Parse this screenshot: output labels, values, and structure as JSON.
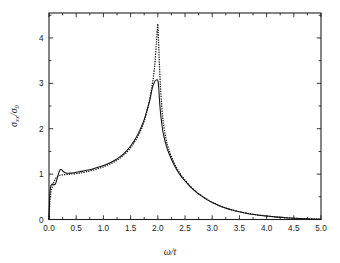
{
  "figure": {
    "background": "#ffffff",
    "foreground": "#1f1f1f"
  },
  "axis": {
    "x_title_main": "ω",
    "x_title_div": "/",
    "x_title_var": "t",
    "y_title_sigma": "σ",
    "y_title_sigma_sub": "xx",
    "y_title_div": "/",
    "y_title_sigma0": "σ",
    "y_title_sigma0_sub": "0",
    "x_ticks": [
      "0.0",
      "0.5",
      "1.0",
      "1.5",
      "2.0",
      "2.5",
      "3.0",
      "3.5",
      "4.0",
      "4.5",
      "5.0"
    ],
    "y_ticks": [
      "0",
      "1",
      "2",
      "3",
      "4"
    ]
  },
  "chart_data": {
    "type": "line",
    "title": "",
    "xlabel": "ω/t",
    "ylabel": "σ_xx/σ_0",
    "xlim": [
      0.0,
      5.0
    ],
    "ylim": [
      0.0,
      4.55
    ],
    "xticks": [
      0.0,
      0.5,
      1.0,
      1.5,
      2.0,
      2.5,
      3.0,
      3.5,
      4.0,
      4.5,
      5.0
    ],
    "yticks": [
      0,
      1,
      2,
      3,
      4
    ],
    "xtick_minor_step": 0.25,
    "ytick_minor_step": 0.5,
    "grid": false,
    "legend": null,
    "annotations": [],
    "series": [
      {
        "name": "solid",
        "style": "solid",
        "color": "#111111",
        "x": [
          0.0,
          0.01,
          0.02,
          0.03,
          0.04,
          0.05,
          0.06,
          0.07,
          0.08,
          0.09,
          0.1,
          0.12,
          0.14,
          0.16,
          0.18,
          0.2,
          0.21,
          0.22,
          0.23,
          0.24,
          0.25,
          0.27,
          0.29,
          0.31,
          0.33,
          0.35,
          0.4,
          0.45,
          0.5,
          0.6,
          0.7,
          0.8,
          0.9,
          1.0,
          1.1,
          1.2,
          1.3,
          1.4,
          1.5,
          1.6,
          1.7,
          1.75,
          1.8,
          1.85,
          1.9,
          1.93,
          1.95,
          1.97,
          1.98,
          1.99,
          2.0,
          2.01,
          2.02,
          2.03,
          2.05,
          2.08,
          2.1,
          2.15,
          2.2,
          2.3,
          2.4,
          2.5,
          2.6,
          2.7,
          2.8,
          2.9,
          3.0,
          3.2,
          3.4,
          3.6,
          3.8,
          4.0,
          4.2,
          4.4,
          4.6,
          4.8,
          5.0
        ],
        "y": [
          0.0,
          0.42,
          0.63,
          0.72,
          0.76,
          0.775,
          0.78,
          0.78,
          0.775,
          0.77,
          0.765,
          0.79,
          0.86,
          0.95,
          1.03,
          1.085,
          1.1,
          1.105,
          1.1,
          1.09,
          1.075,
          1.05,
          1.035,
          1.025,
          1.02,
          1.018,
          1.022,
          1.03,
          1.04,
          1.06,
          1.085,
          1.115,
          1.15,
          1.19,
          1.24,
          1.3,
          1.38,
          1.48,
          1.62,
          1.8,
          2.05,
          2.2,
          2.4,
          2.62,
          2.9,
          3.0,
          3.05,
          3.07,
          3.08,
          3.08,
          3.07,
          3.0,
          2.85,
          2.65,
          2.35,
          2.05,
          1.9,
          1.65,
          1.47,
          1.2,
          1.0,
          0.85,
          0.72,
          0.61,
          0.52,
          0.44,
          0.375,
          0.27,
          0.2,
          0.145,
          0.105,
          0.075,
          0.052,
          0.035,
          0.022,
          0.012,
          0.005
        ]
      },
      {
        "name": "dotted",
        "style": "dotted",
        "color": "#111111",
        "x": [
          0.0,
          0.01,
          0.02,
          0.03,
          0.04,
          0.05,
          0.06,
          0.08,
          0.1,
          0.12,
          0.15,
          0.2,
          0.25,
          0.3,
          0.35,
          0.4,
          0.5,
          0.6,
          0.7,
          0.8,
          0.9,
          1.0,
          1.1,
          1.2,
          1.3,
          1.4,
          1.5,
          1.6,
          1.7,
          1.75,
          1.8,
          1.85,
          1.9,
          1.93,
          1.95,
          1.97,
          1.98,
          1.99,
          2.0,
          2.005,
          2.01,
          2.02,
          2.03,
          2.05,
          2.08,
          2.1,
          2.15,
          2.2,
          2.3,
          2.4,
          2.5,
          2.6,
          2.7,
          2.8,
          2.9,
          3.0,
          3.2,
          3.4,
          3.6,
          3.8,
          4.0,
          4.2,
          4.4,
          4.6,
          4.8,
          5.0
        ],
        "y": [
          0.0,
          0.3,
          0.46,
          0.56,
          0.63,
          0.68,
          0.72,
          0.79,
          0.85,
          0.895,
          0.94,
          0.975,
          0.985,
          0.99,
          0.995,
          1.0,
          1.01,
          1.03,
          1.055,
          1.085,
          1.12,
          1.16,
          1.21,
          1.27,
          1.35,
          1.45,
          1.58,
          1.76,
          2.0,
          2.17,
          2.38,
          2.64,
          2.98,
          3.25,
          3.48,
          3.82,
          4.0,
          4.18,
          4.31,
          4.2,
          4.05,
          3.72,
          3.4,
          2.9,
          2.4,
          2.15,
          1.78,
          1.55,
          1.25,
          1.03,
          0.87,
          0.73,
          0.62,
          0.53,
          0.45,
          0.38,
          0.275,
          0.2,
          0.148,
          0.107,
          0.077,
          0.053,
          0.036,
          0.022,
          0.012,
          0.005
        ]
      }
    ]
  }
}
